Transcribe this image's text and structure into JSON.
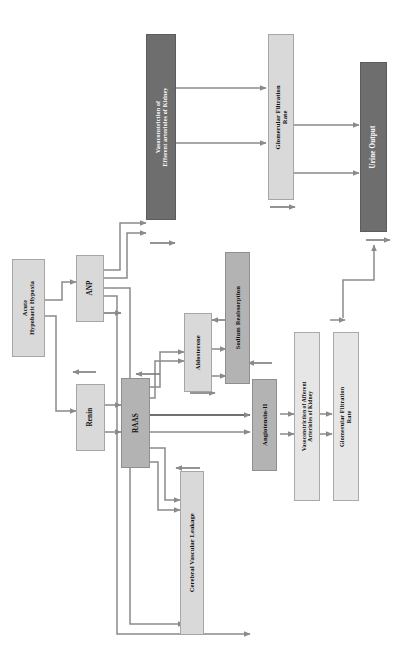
{
  "diagram": {
    "orientation": "rotated-90",
    "colors": {
      "light_box": "#d9d9d9",
      "lighter_box": "#e6e6e6",
      "mid_box": "#b3b3b3",
      "dark_box": "#6e6e6e",
      "line": "#8a8a8a",
      "line_dark": "#707070",
      "text_dark": "#111111",
      "text_light": "#ffffff",
      "background": "#ffffff"
    },
    "nodes": [
      {
        "id": "acute_hypoxia",
        "label": "Acute\nHypobaric Hypoxia",
        "style": "light"
      },
      {
        "id": "anp",
        "label": "ANP",
        "style": "light"
      },
      {
        "id": "renin",
        "label": "Renin",
        "style": "light"
      },
      {
        "id": "raas",
        "label": "RAAS",
        "style": "mid"
      },
      {
        "id": "aldosterone",
        "label": "Aldosterone",
        "style": "light"
      },
      {
        "id": "sodium_reabsorption",
        "label": "Sodium Reabsorption",
        "style": "mid"
      },
      {
        "id": "cerebral_leakage",
        "label": "Cerebral Vascular Leakage",
        "style": "light"
      },
      {
        "id": "angiotensin_ii",
        "label": "Angiotensin-II",
        "style": "mid"
      },
      {
        "id": "vaso_afferent",
        "label": "Vasoconstriction of Afferent\nArterioles of Kidney",
        "style": "lighter"
      },
      {
        "id": "gfr_bottom",
        "label": "Glomerular Filtration\nRate",
        "style": "lighter"
      },
      {
        "id": "vaso_efferent",
        "label": "Vasoconstriction of\nEfferent arterioles of Kidney",
        "style": "dark"
      },
      {
        "id": "gfr_top",
        "label": "Glomerular Filtration\nRate",
        "style": "light"
      },
      {
        "id": "urine_output",
        "label": "Urine Output",
        "style": "dark"
      }
    ],
    "edges": [
      {
        "from": "acute_hypoxia",
        "to": "anp"
      },
      {
        "from": "acute_hypoxia",
        "to": "renin"
      },
      {
        "from": "renin",
        "to": "raas"
      },
      {
        "from": "raas",
        "to": "aldosterone"
      },
      {
        "from": "raas",
        "to": "angiotensin_ii"
      },
      {
        "from": "raas",
        "to": "cerebral_leakage"
      },
      {
        "from": "anp",
        "to": "vaso_efferent"
      },
      {
        "from": "anp",
        "to": "aldosterone"
      },
      {
        "from": "anp",
        "to": "angiotensin_ii"
      },
      {
        "from": "aldosterone",
        "to": "sodium_reabsorption"
      },
      {
        "from": "angiotensin_ii",
        "to": "vaso_afferent"
      },
      {
        "from": "vaso_afferent",
        "to": "gfr_bottom"
      },
      {
        "from": "vaso_efferent",
        "to": "gfr_top"
      },
      {
        "from": "gfr_top",
        "to": "urine_output"
      },
      {
        "from": "gfr_bottom",
        "to": "urine_output"
      }
    ],
    "indicator_arrows": [
      {
        "id": "ind-anp-up",
        "direction": "up"
      },
      {
        "id": "ind-renin-down",
        "direction": "down"
      },
      {
        "id": "ind-raas-down",
        "direction": "down"
      },
      {
        "id": "ind-vaso-efferent-up",
        "direction": "up"
      },
      {
        "id": "ind-gfr-top-up",
        "direction": "up"
      },
      {
        "id": "ind-aldosterone-up",
        "direction": "up"
      },
      {
        "id": "ind-sodium-down",
        "direction": "down"
      },
      {
        "id": "ind-angiotensin-down",
        "direction": "down"
      },
      {
        "id": "ind-cerebral-down",
        "direction": "down"
      },
      {
        "id": "ind-urine-up",
        "direction": "up"
      },
      {
        "id": "ind-gfr-bottom-down",
        "direction": "down"
      }
    ]
  }
}
